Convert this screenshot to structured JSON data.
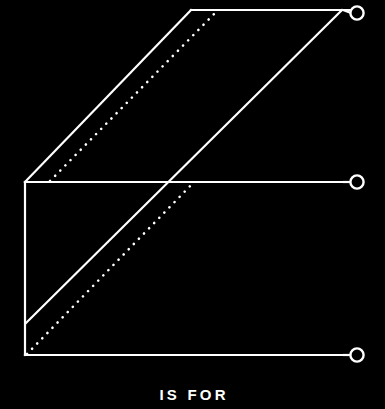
{
  "poster": {
    "caption": "IS FOR",
    "background_color": "#000000",
    "stroke_color": "#ffffff"
  },
  "figure": {
    "name": "isometric-line-diagram",
    "stroke_width": 2.2,
    "dotted_stroke_width": 2.6,
    "dot_spacing": 7.2,
    "circle_radius": 6.6,
    "circle_stroke_width": 2.4,
    "shapes": {
      "top_horizontal": {
        "name": "top-horizontal-line",
        "x1": 191,
        "y1": 10,
        "x2": 350,
        "y2": 10
      },
      "middle_horizontal": {
        "name": "middle-horizontal-line",
        "x1": 25,
        "y1": 182,
        "x2": 350,
        "y2": 182
      },
      "bottom_horizontal": {
        "name": "bottom-horizontal-line",
        "x1": 25,
        "y1": 355,
        "x2": 350,
        "y2": 355
      },
      "left_vertical": {
        "name": "left-vertical-line",
        "x1": 25,
        "y1": 182,
        "x2": 25,
        "y2": 355
      },
      "upper_left_diagonal": {
        "name": "upper-left-diagonal-line",
        "x1": 25,
        "y1": 182,
        "x2": 191,
        "y2": 10
      },
      "long_diagonal": {
        "name": "long-diagonal-line",
        "x1": 26,
        "y1": 323,
        "x2": 342,
        "y2": 10
      },
      "dotted_upper_diagonal": {
        "name": "dotted-upper-diagonal-line",
        "x1": 50,
        "y1": 181,
        "x2": 216,
        "y2": 12
      },
      "dotted_lower_diagonal": {
        "name": "dotted-lower-diagonal-line",
        "x1": 27,
        "y1": 354,
        "x2": 194,
        "y2": 182
      }
    },
    "circles": [
      {
        "name": "terminal-circle-top",
        "cx": 357,
        "cy": 13,
        "label": "top"
      },
      {
        "name": "terminal-circle-middle",
        "cx": 357,
        "cy": 182,
        "label": "middle"
      },
      {
        "name": "terminal-circle-bottom",
        "cx": 357,
        "cy": 355,
        "label": "bottom"
      }
    ],
    "connectors": [
      {
        "name": "top-circle-connector",
        "x1": 343,
        "y1": 10,
        "x2": 351,
        "y2": 13
      },
      {
        "name": "middle-circle-connector",
        "x1": 343,
        "y1": 182,
        "x2": 351,
        "y2": 182
      },
      {
        "name": "bottom-circle-connector",
        "x1": 343,
        "y1": 355,
        "x2": 351,
        "y2": 355
      }
    ]
  }
}
